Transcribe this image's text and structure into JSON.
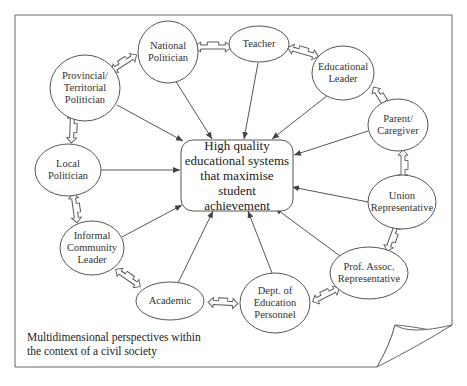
{
  "diagram": {
    "center": {
      "label": "High quality\neducational systems\nthat maximise student\nachievement"
    },
    "nodes": [
      {
        "id": "national-politician",
        "label": "National\nPolitician"
      },
      {
        "id": "teacher",
        "label": "Teacher"
      },
      {
        "id": "educational-leader",
        "label": "Educational\nLeader"
      },
      {
        "id": "parent-caregiver",
        "label": "Parent/\nCaregiver"
      },
      {
        "id": "union-representative",
        "label": "Union\nRepresentative"
      },
      {
        "id": "prof-assoc-representative",
        "label": "Prof. Assoc.\nRepresentative"
      },
      {
        "id": "dept-of-education-personnel",
        "label": "Dept. of\nEducation\nPersonnel"
      },
      {
        "id": "academic",
        "label": "Academic"
      },
      {
        "id": "informal-community-leader",
        "label": "Informal\nCommunity\nLeader"
      },
      {
        "id": "local-politician",
        "label": "Local\nPolitician"
      },
      {
        "id": "provincial-territorial-politician",
        "label": "Provincial/\nTerritorial\nPolitician"
      }
    ],
    "edges_to_center": [
      "national-politician",
      "teacher",
      "educational-leader",
      "parent-caregiver",
      "union-representative",
      "prof-assoc-representative",
      "dept-of-education-personnel",
      "academic",
      "informal-community-leader",
      "local-politician",
      "provincial-territorial-politician"
    ],
    "bidirectional_links": [
      [
        "national-politician",
        "teacher"
      ],
      [
        "teacher",
        "educational-leader"
      ],
      [
        "educational-leader",
        "parent-caregiver"
      ],
      [
        "parent-caregiver",
        "union-representative"
      ],
      [
        "union-representative",
        "prof-assoc-representative"
      ],
      [
        "prof-assoc-representative",
        "dept-of-education-personnel"
      ],
      [
        "dept-of-education-personnel",
        "academic"
      ],
      [
        "academic",
        "informal-community-leader"
      ],
      [
        "informal-community-leader",
        "local-politician"
      ],
      [
        "local-politician",
        "provincial-territorial-politician"
      ],
      [
        "provincial-territorial-politician",
        "national-politician"
      ]
    ],
    "caption": "Multidimensional perspectives within\nthe context of a civil society"
  },
  "colors": {
    "stroke": "#555555",
    "background": "#ffffff"
  }
}
